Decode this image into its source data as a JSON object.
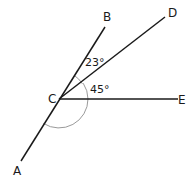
{
  "diagram": {
    "type": "angle-diagram",
    "vertex": {
      "label": "C",
      "x": 59,
      "y": 99
    },
    "rays": [
      {
        "name": "CB",
        "label": "B",
        "end": {
          "x": 105,
          "y": 27
        },
        "label_pos": {
          "x": 103,
          "y": 21
        }
      },
      {
        "name": "CD",
        "label": "D",
        "end": {
          "x": 165,
          "y": 17
        },
        "label_pos": {
          "x": 168,
          "y": 17
        }
      },
      {
        "name": "CE",
        "label": "E",
        "end": {
          "x": 178,
          "y": 99
        },
        "label_pos": {
          "x": 178,
          "y": 104
        }
      },
      {
        "name": "CA",
        "label": "A",
        "end": {
          "x": 21,
          "y": 161
        },
        "label_pos": {
          "x": 13,
          "y": 175
        }
      }
    ],
    "angles": [
      {
        "name": "angle-BCD",
        "value": "23°",
        "label_pos": {
          "x": 85,
          "y": 66
        }
      },
      {
        "name": "angle-DCE",
        "value": "45°",
        "label_pos": {
          "x": 90,
          "y": 93
        }
      },
      {
        "name": "angle-ECA",
        "value": "",
        "note": "unlabeled reflex-side arc"
      }
    ],
    "colors": {
      "line": "#1a1a1a",
      "arc": "#9a9a9a",
      "text": "#1a1a1a"
    }
  }
}
